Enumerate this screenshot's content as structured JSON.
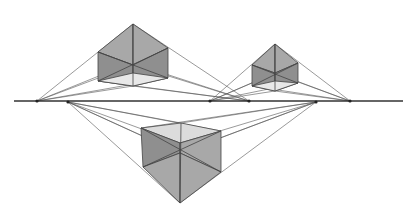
{
  "colors": {
    "background": "#ffffff",
    "horizon": "#333333",
    "guide_line": "#555555",
    "edge": "#444444",
    "face_dark": "#8f8f8f",
    "face_mid": "#a8a8a8",
    "face_light": "#dcdcdc",
    "face_lighter": "#e8e8e8"
  },
  "horizon": {
    "x1": 14,
    "y1": 101,
    "x2": 403,
    "y2": 101
  },
  "vanishing_points": [
    {
      "id": "vp-a",
      "x": 37,
      "y": 101
    },
    {
      "id": "vp-b",
      "x": 68,
      "y": 102
    },
    {
      "id": "vp-c",
      "x": 210,
      "y": 101
    },
    {
      "id": "vp-d",
      "x": 249,
      "y": 101
    },
    {
      "id": "vp-e",
      "x": 316,
      "y": 102
    },
    {
      "id": "vp-f",
      "x": 350,
      "y": 101
    }
  ],
  "cubes": [
    {
      "id": "cube-upper-left",
      "position": "above horizon",
      "vertices": {
        "top": [
          133,
          24
        ],
        "left_top": [
          98,
          52
        ],
        "right_top": [
          168,
          48
        ],
        "center": [
          133,
          65
        ],
        "left_bottom": [
          98,
          81
        ],
        "right_bottom": [
          168,
          78
        ],
        "bottom": [
          133,
          86
        ]
      },
      "vps": [
        "vp-a",
        "vp-d"
      ]
    },
    {
      "id": "cube-upper-right",
      "position": "above horizon",
      "vertices": {
        "top": [
          275,
          44
        ],
        "left_top": [
          252,
          65
        ],
        "right_top": [
          298,
          63
        ],
        "center": [
          275,
          73
        ],
        "left_bottom": [
          252,
          86
        ],
        "right_bottom": [
          298,
          83
        ],
        "bottom": [
          275,
          91
        ]
      },
      "vps": [
        "vp-c",
        "vp-f"
      ]
    },
    {
      "id": "cube-lower",
      "position": "below horizon",
      "vertices": {
        "back_top": [
          181,
          123
        ],
        "left_top": [
          141,
          128
        ],
        "right_top": [
          221,
          131
        ],
        "front_top": [
          180,
          143
        ],
        "center": [
          180,
          153
        ],
        "left_bottom": [
          143,
          167
        ],
        "right_bottom": [
          221,
          172
        ],
        "bottom": [
          180,
          203
        ]
      },
      "vps": [
        "vp-b",
        "vp-e"
      ]
    }
  ]
}
